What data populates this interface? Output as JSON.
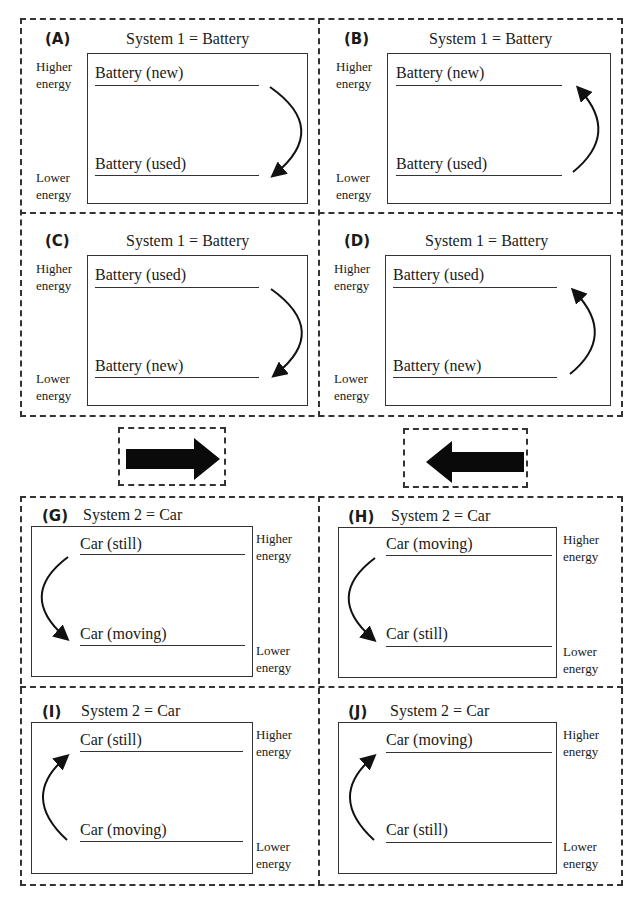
{
  "figure": {
    "top_group": {
      "panels": [
        {
          "id": "A",
          "letter": "(A)",
          "title": "System 1 = Battery",
          "upper_level": "Battery (new)",
          "lower_level": "Battery (used)",
          "arrow_direction": "down",
          "arrow_side": "right",
          "higher_label": [
            "Higher",
            "energy"
          ],
          "lower_label": [
            "Lower",
            "energy"
          ]
        },
        {
          "id": "B",
          "letter": "(B)",
          "title": "System 1 = Battery",
          "upper_level": "Battery (new)",
          "lower_level": "Battery (used)",
          "arrow_direction": "up",
          "arrow_side": "right",
          "higher_label": [
            "Higher",
            "energy"
          ],
          "lower_label": [
            "Lower",
            "energy"
          ]
        },
        {
          "id": "C",
          "letter": "(C)",
          "title": "System 1 = Battery",
          "upper_level": "Battery (used)",
          "lower_level": "Battery (new)",
          "arrow_direction": "down",
          "arrow_side": "right",
          "higher_label": [
            "Higher",
            "energy"
          ],
          "lower_label": [
            "Lower",
            "energy"
          ]
        },
        {
          "id": "D",
          "letter": "(D)",
          "title": "System 1 = Battery",
          "upper_level": "Battery (used)",
          "lower_level": "Battery (new)",
          "arrow_direction": "up",
          "arrow_side": "right",
          "higher_label": [
            "Higher",
            "energy"
          ],
          "lower_label": [
            "Lower",
            "energy"
          ]
        }
      ]
    },
    "transfer": [
      {
        "id": "E",
        "letter": "(E)",
        "label": "Energy transferred",
        "direction": "right"
      },
      {
        "id": "F",
        "letter": "(F)",
        "label": "Energy transferred",
        "direction": "left"
      }
    ],
    "bottom_group": {
      "panels": [
        {
          "id": "G",
          "letter": "(G)",
          "title": "System 2 = Car",
          "upper_level": "Car (still)",
          "lower_level": "Car (moving)",
          "arrow_direction": "down",
          "arrow_side": "left",
          "higher_label": [
            "Higher",
            "energy"
          ],
          "lower_label": [
            "Lower",
            "energy"
          ]
        },
        {
          "id": "H",
          "letter": "(H)",
          "title": "System 2 = Car",
          "upper_level": "Car (moving)",
          "lower_level": "Car (still)",
          "arrow_direction": "down",
          "arrow_side": "left",
          "higher_label": [
            "Higher",
            "energy"
          ],
          "lower_label": [
            "Lower",
            "energy"
          ]
        },
        {
          "id": "I",
          "letter": "(I)",
          "title": "System 2 = Car",
          "upper_level": "Car (still)",
          "lower_level": "Car (moving)",
          "arrow_direction": "up",
          "arrow_side": "left",
          "higher_label": [
            "Higher",
            "energy"
          ],
          "lower_label": [
            "Lower",
            "energy"
          ]
        },
        {
          "id": "J",
          "letter": "(J)",
          "title": "System 2 = Car",
          "upper_level": "Car (moving)",
          "lower_level": "Car (still)",
          "arrow_direction": "up",
          "arrow_side": "left",
          "higher_label": [
            "Higher",
            "energy"
          ],
          "lower_label": [
            "Lower",
            "energy"
          ]
        }
      ]
    }
  }
}
